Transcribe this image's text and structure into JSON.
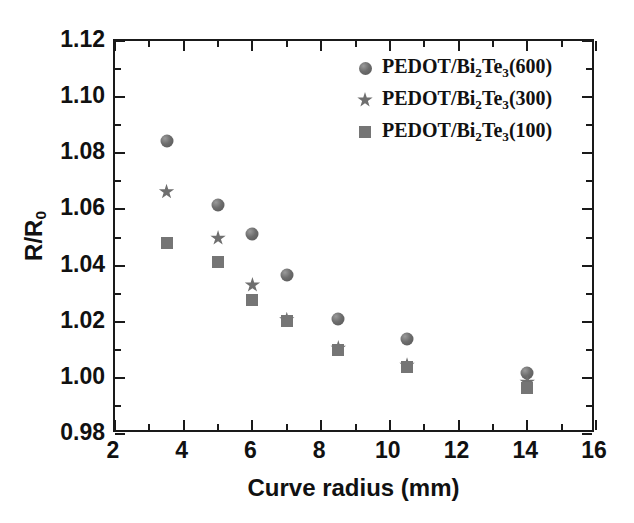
{
  "chart_data": {
    "type": "scatter",
    "title": "",
    "xlabel": "Curve radius (mm)",
    "ylabel": "R/R0",
    "ylabel_base": "R/R",
    "ylabel_sub": "0",
    "xlim": [
      2,
      16
    ],
    "ylim": [
      0.98,
      1.12
    ],
    "xticks": [
      2,
      4,
      6,
      8,
      10,
      12,
      14,
      16
    ],
    "xtick_labels": [
      "2",
      "4",
      "6",
      "8",
      "10",
      "12",
      "14",
      "16"
    ],
    "yticks": [
      0.98,
      1.0,
      1.02,
      1.04,
      1.06,
      1.08,
      1.1,
      1.12
    ],
    "ytick_labels": [
      "0.98",
      "1.00",
      "1.02",
      "1.04",
      "1.06",
      "1.08",
      "1.10",
      "1.12"
    ],
    "x_minor_ticks": [
      3,
      5,
      7,
      9,
      11,
      13,
      15
    ],
    "y_minor_ticks": [
      0.99,
      1.01,
      1.03,
      1.05,
      1.07,
      1.09,
      1.11
    ],
    "grid": false,
    "legend_position": "top-right",
    "series": [
      {
        "name": "PEDOT/Bi2Te3(600)",
        "label_parts": [
          "PEDOT/Bi",
          "2",
          "Te",
          "3",
          "(600)"
        ],
        "marker": "circle",
        "color": "#6d6d6d",
        "x": [
          3.5,
          5.0,
          6.0,
          7.0,
          8.5,
          10.5,
          14.0
        ],
        "y": [
          1.0845,
          1.0616,
          1.0513,
          1.0367,
          1.0211,
          1.014,
          1.0018
        ]
      },
      {
        "name": "PEDOT/Bi2Te3(300)",
        "label_parts": [
          "PEDOT/Bi",
          "2",
          "Te",
          "3",
          "(300)"
        ],
        "marker": "star",
        "color": "#6f6f6f",
        "x": [
          3.5,
          5.0,
          6.0,
          7.0,
          8.5,
          10.5,
          14.0
        ],
        "y": [
          1.0663,
          1.0498,
          1.0331,
          1.0207,
          1.0106,
          1.0045,
          0.9985
        ]
      },
      {
        "name": "PEDOT/Bi2Te3(100)",
        "label_parts": [
          "PEDOT/Bi",
          "2",
          "Te",
          "3",
          "(100)"
        ],
        "marker": "square",
        "color": "#757575",
        "x": [
          3.5,
          5.0,
          6.0,
          7.0,
          8.5,
          10.5,
          14.0
        ],
        "y": [
          1.0479,
          1.0413,
          1.0276,
          1.0203,
          1.0101,
          1.0037,
          0.9963
        ]
      }
    ]
  }
}
